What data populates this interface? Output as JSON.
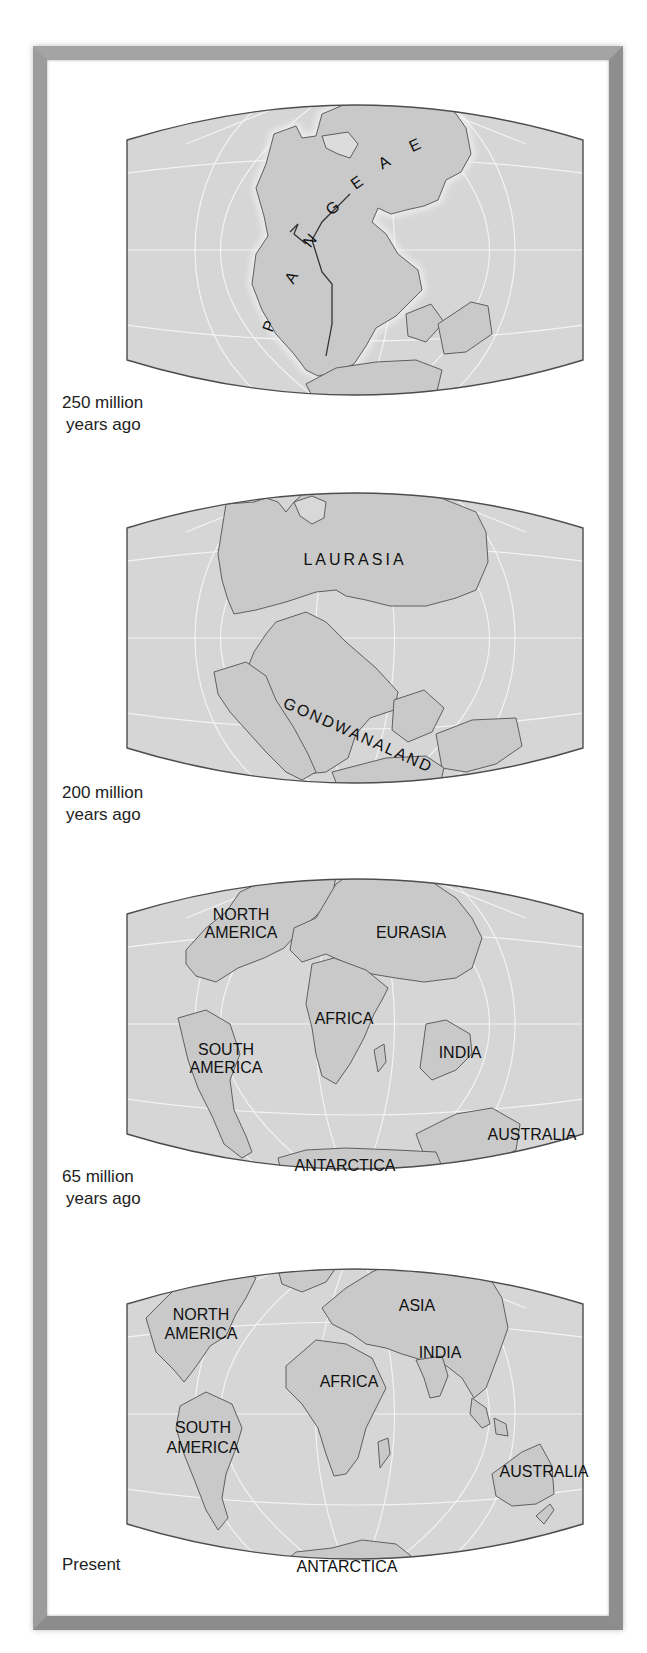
{
  "figure": {
    "colors": {
      "land": "#c9c9c9",
      "ocean": "#d6d6d6",
      "coastline": "#5f5f5f",
      "grid": "#f4f4f4",
      "frame": "#9a9a9a",
      "text": "#222222"
    }
  },
  "panels": [
    {
      "era_line1": "250 million",
      "era_line2": "years ago",
      "labels": [
        {
          "text": "P",
          "x": 148,
          "y": 244,
          "rotate": -70
        },
        {
          "text": "A",
          "x": 170,
          "y": 196,
          "rotate": -60
        },
        {
          "text": "N",
          "x": 188,
          "y": 160,
          "rotate": -50
        },
        {
          "text": "G",
          "x": 210,
          "y": 128,
          "rotate": -40
        },
        {
          "text": "E",
          "x": 234,
          "y": 103,
          "rotate": -35
        },
        {
          "text": "A",
          "x": 261,
          "y": 83,
          "rotate": -30
        },
        {
          "text": "E",
          "x": 291,
          "y": 66,
          "rotate": -25
        }
      ]
    },
    {
      "era_line1": "200 million",
      "era_line2": "years ago",
      "labels": [
        {
          "text": "LAURASIA",
          "x": 229,
          "y": 93,
          "rotate": 0,
          "spacing": 3
        },
        {
          "text": "GONDWANALAND",
          "x": 230,
          "y": 268,
          "rotate": 24,
          "spacing": 2
        }
      ]
    },
    {
      "era_line1": "65 million",
      "era_line2": "years ago",
      "labels": [
        {
          "text": "NORTH",
          "x": 115,
          "y": 62,
          "rotate": 0
        },
        {
          "text": "AMERICA",
          "x": 115,
          "y": 80,
          "rotate": 0
        },
        {
          "text": "EURASIA",
          "x": 285,
          "y": 80,
          "rotate": 0
        },
        {
          "text": "AFRICA",
          "x": 218,
          "y": 166,
          "rotate": 0
        },
        {
          "text": "SOUTH",
          "x": 100,
          "y": 197,
          "rotate": 0
        },
        {
          "text": "AMERICA",
          "x": 100,
          "y": 215,
          "rotate": 0
        },
        {
          "text": "INDIA",
          "x": 334,
          "y": 200,
          "rotate": 0
        },
        {
          "text": "AUSTRALIA",
          "x": 406,
          "y": 282,
          "rotate": 0
        },
        {
          "text": "ANTARCTICA",
          "x": 219,
          "y": 313,
          "rotate": 0
        }
      ]
    },
    {
      "era_line1": "Present",
      "era_line2": "",
      "labels": [
        {
          "text": "NORTH",
          "x": 75,
          "y": 72,
          "rotate": 0
        },
        {
          "text": "AMERICA",
          "x": 75,
          "y": 91,
          "rotate": 0
        },
        {
          "text": "ASIA",
          "x": 291,
          "y": 63,
          "rotate": 0
        },
        {
          "text": "INDIA",
          "x": 314,
          "y": 110,
          "rotate": 0
        },
        {
          "text": "AFRICA",
          "x": 223,
          "y": 139,
          "rotate": 0
        },
        {
          "text": "SOUTH",
          "x": 77,
          "y": 185,
          "rotate": 0
        },
        {
          "text": "AMERICA",
          "x": 77,
          "y": 205,
          "rotate": 0
        },
        {
          "text": "AUSTRALIA",
          "x": 418,
          "y": 229,
          "rotate": 0
        },
        {
          "text": "ANTARCTICA",
          "x": 221,
          "y": 324,
          "rotate": 0
        }
      ]
    }
  ]
}
